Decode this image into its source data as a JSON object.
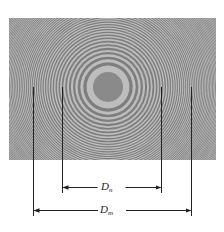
{
  "figure": {
    "photo": {
      "x": 9,
      "y": 18,
      "width": 207,
      "height": 142,
      "center_x": 108,
      "center_y": 87,
      "background_color": "#a2a2a2",
      "dark_ring_color": "#7e7e7e",
      "light_ring_color": "#bdbdbd",
      "central_spot_color": "#8a8a8a",
      "central_spot_radius": 15,
      "ring_scale": 17.5,
      "ring_count": 60
    },
    "measurements": [
      {
        "id": "Dn",
        "symbol": "D",
        "subscript": "n",
        "left_x": 62,
        "right_x": 161,
        "line_top_y": 87,
        "line_bottom_y": 193,
        "arrow_y": 187
      },
      {
        "id": "Dm",
        "symbol": "D",
        "subscript": "m",
        "left_x": 33,
        "right_x": 191,
        "line_top_y": 87,
        "line_bottom_y": 216,
        "arrow_y": 210
      }
    ],
    "line_color": "#222222"
  }
}
